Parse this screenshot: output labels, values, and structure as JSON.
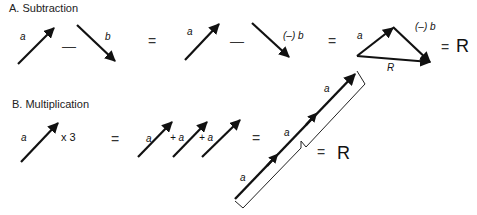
{
  "section_a": {
    "title": "A.  Subtraction",
    "vec_a_label": "a",
    "minus": "—",
    "vec_b_label": "b",
    "equals": "=",
    "vec_a2_label": "a",
    "minus2": "—",
    "neg_b_label": "(–) b",
    "equals2": "=",
    "tri_a_label": "a",
    "tri_negb_label": "(–) b",
    "tri_r_label": "R",
    "equals3": "=",
    "result": "R"
  },
  "section_b": {
    "title": "B.  Multiplication",
    "vec_a_label": "a",
    "times_label": "x 3",
    "equals": "=",
    "sum_labels": [
      "a",
      "+ a",
      "+ a"
    ],
    "equals2": "=",
    "chain_labels": [
      "a",
      "a",
      "a"
    ],
    "equals3": "=",
    "result": "R"
  }
}
